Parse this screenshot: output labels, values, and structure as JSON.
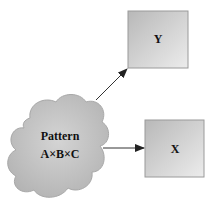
{
  "diagram": {
    "nodes": [
      {
        "id": "pattern",
        "shape": "cloud",
        "lines": [
          "Pattern",
          "A×B×C"
        ]
      },
      {
        "id": "y",
        "shape": "box",
        "label": "Y"
      },
      {
        "id": "x",
        "shape": "box",
        "label": "X"
      }
    ],
    "edges": [
      {
        "from": "pattern",
        "to": "y"
      },
      {
        "from": "pattern",
        "to": "x"
      }
    ],
    "colors": {
      "fill_light": "#e8e8e8",
      "fill_dark": "#b8b8b8",
      "stroke": "#9a9a9a",
      "arrow": "#222222",
      "text": "#111111"
    }
  }
}
